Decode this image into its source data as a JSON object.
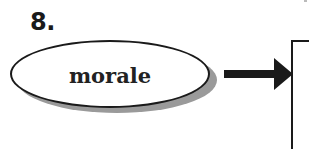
{
  "diagram": {
    "item_number": "8.",
    "node": {
      "label": "morale",
      "shape": "ellipse",
      "fill": "#ffffff",
      "border_color": "#1a1a1a",
      "shadow_color": "#9a9a9a"
    },
    "connector": {
      "type": "arrow",
      "direction": "right",
      "color": "#1a1a1a"
    },
    "target": {
      "shape": "box",
      "label": ""
    }
  }
}
